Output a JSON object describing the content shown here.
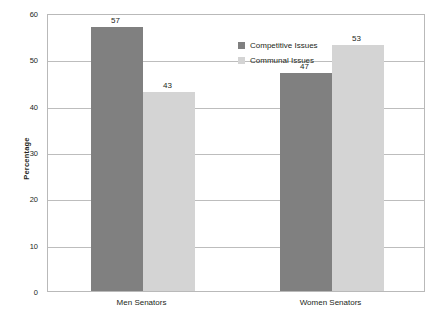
{
  "chart_data": {
    "type": "bar",
    "title": "",
    "subtitle": "",
    "xlabel": "",
    "ylabel": "Percentage",
    "categories": [
      "Men Senators",
      "Women Senators"
    ],
    "series": [
      {
        "name": "Competitive Issues",
        "color": "#808080",
        "values": [
          57,
          47
        ]
      },
      {
        "name": "Communal Issues",
        "color": "#d4d4d4",
        "values": [
          43,
          53
        ]
      }
    ],
    "ylim": [
      0,
      60
    ],
    "y_ticks": [
      0,
      10,
      20,
      30,
      40,
      50,
      60
    ],
    "y_tick_labels": [
      "0",
      "10",
      "20",
      "30",
      "40",
      "50",
      "60"
    ],
    "grid": true,
    "grid_axis": "y",
    "legend_position": "inside-upper-center",
    "data_labels": [
      "57",
      "43",
      "47",
      "53"
    ],
    "bar_group_labels": [
      {
        "category": "Men Senators",
        "values": [
          "57",
          "43"
        ]
      },
      {
        "category": "Women Senators",
        "values": [
          "47",
          "53"
        ]
      }
    ]
  },
  "legend": {
    "items": [
      {
        "label": "Competitive Issues"
      },
      {
        "label": "Communal Issues"
      }
    ]
  },
  "axis": {
    "y_title": "Percentage"
  }
}
